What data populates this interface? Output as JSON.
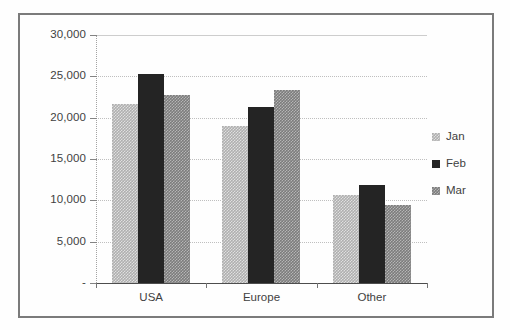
{
  "chart_data": {
    "type": "bar",
    "title": "",
    "subtitle": "",
    "xlabel": "",
    "ylabel": "",
    "categories": [
      "USA",
      "Europe",
      "Other"
    ],
    "series": [
      {
        "name": "Jan",
        "values": [
          21600,
          19000,
          10600
        ],
        "color": "#a8a8a8",
        "pattern": "light-gray-dither"
      },
      {
        "name": "Feb",
        "values": [
          25300,
          21300,
          11900
        ],
        "color": "#0d0d0d",
        "pattern": "solid-black"
      },
      {
        "name": "Mar",
        "values": [
          22800,
          23400,
          9400
        ],
        "color": "#6f6f6f",
        "pattern": "medium-gray-dither"
      }
    ],
    "ylim": [
      0,
      30000
    ],
    "ytick_values": [
      0,
      5000,
      10000,
      15000,
      20000,
      25000,
      30000
    ],
    "ytick_labels": [
      "-",
      "5,000",
      "10,000",
      "15,000",
      "20,000",
      "25,000",
      "30,000"
    ],
    "grid": true,
    "grid_axis": "y",
    "legend_position": "right",
    "legend_entries": [
      "Jan",
      "Feb",
      "Mar"
    ]
  },
  "axes": {
    "y_ticks": [
      {
        "label": "30,000",
        "value": 30000
      },
      {
        "label": "25,000",
        "value": 25000
      },
      {
        "label": "20,000",
        "value": 20000
      },
      {
        "label": "15,000",
        "value": 15000
      },
      {
        "label": "10,000",
        "value": 10000
      },
      {
        "label": "5,000",
        "value": 5000
      },
      {
        "label": "-",
        "value": 0
      }
    ],
    "x_categories": [
      "USA",
      "Europe",
      "Other"
    ]
  },
  "legend": {
    "items": [
      {
        "label": "Jan",
        "swatch": "jan"
      },
      {
        "label": "Feb",
        "swatch": "feb"
      },
      {
        "label": "Mar",
        "swatch": "mar"
      }
    ]
  },
  "colors": {
    "series_jan": "#a8a8a8",
    "series_feb": "#0d0d0d",
    "series_mar": "#6f6f6f",
    "frame_border": "#6e6e6e",
    "gridline": "#b9b9b9",
    "axis_line": "#3a3a3a",
    "text": "#2b2b2b",
    "background": "#ffffff"
  }
}
